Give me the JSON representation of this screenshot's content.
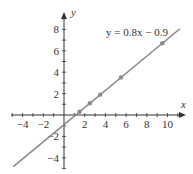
{
  "chart_data": {
    "type": "line",
    "title": "",
    "xlabel": "x",
    "ylabel": "y",
    "xlim": [
      -5,
      11
    ],
    "ylim": [
      -5,
      9.5
    ],
    "grid": false,
    "x_ticks": [
      -4,
      -2,
      2,
      4,
      6,
      8,
      10
    ],
    "y_ticks": [
      -4,
      -2,
      2,
      4,
      6,
      8
    ],
    "x_tick_labels": [
      "−4",
      "−2",
      "2",
      "4",
      "6",
      "8",
      "10"
    ],
    "y_tick_labels": [
      "−4",
      "−2",
      "2",
      "4",
      "6",
      "8"
    ],
    "annotation": "y = 0.8x − 0.9",
    "series": [
      {
        "name": "y = 0.8x - 0.9",
        "kind": "line",
        "slope": 0.8,
        "intercept": -0.9,
        "x_range": [
          -5,
          11
        ]
      },
      {
        "name": "data points",
        "kind": "scatter",
        "x": [
          1.5,
          2.5,
          3.5,
          5.5,
          9.5
        ],
        "y": [
          0.3,
          1.1,
          1.9,
          3.5,
          6.7
        ]
      }
    ],
    "colors": {
      "line": "#8a8a8a",
      "points": "#8a8a8a",
      "axes": "#333333"
    }
  }
}
